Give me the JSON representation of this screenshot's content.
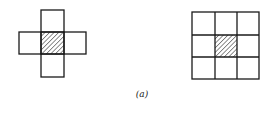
{
  "figure": {
    "caption": "(a)",
    "colors": {
      "stroke": "#1a1a1a",
      "hatch": "#333333",
      "background": "#ffffff"
    },
    "left_diagram": {
      "name": "von-neumann-neighborhood",
      "description": "Plus-shaped arrangement of 5 cells; center cell hatched",
      "cells": [
        {
          "row": 0,
          "col": 1,
          "hatched": false
        },
        {
          "row": 1,
          "col": 0,
          "hatched": false
        },
        {
          "row": 1,
          "col": 1,
          "hatched": true
        },
        {
          "row": 1,
          "col": 2,
          "hatched": false
        },
        {
          "row": 2,
          "col": 1,
          "hatched": false
        }
      ]
    },
    "right_diagram": {
      "name": "moore-neighborhood",
      "description": "3x3 grid of 9 cells; center cell hatched",
      "rows": 3,
      "cols": 3,
      "hatched_cell": {
        "row": 1,
        "col": 1
      }
    }
  }
}
